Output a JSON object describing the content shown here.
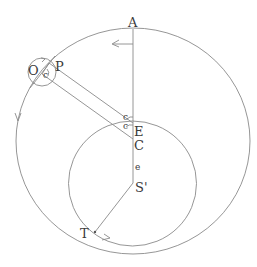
{
  "diagram": {
    "type": "geometric construction (orbit diagram)",
    "colors": {
      "line": "#8a8a8a",
      "text": "#3a3a3a",
      "background": "#ffffff"
    },
    "labels": {
      "A": "A",
      "P": "P",
      "O": "O",
      "E": "E",
      "C": "C",
      "S": "S'",
      "T": "T",
      "e_axis": "e",
      "c_upper": "c",
      "c_lower": "c",
      "c_small_circle": "c"
    },
    "shapes": {
      "outer_circle": "large circle (deferent)",
      "inner_circle": "smaller circle centered on S'",
      "small_circle": "epicycle at O",
      "vertical_line": "line A–S'",
      "band": "parallel lines from O/P to E/C",
      "line_ST": "line S'–T"
    },
    "arrows": [
      "arrow near A pointing left",
      "arrow on outer circle left pointing down",
      "arrow near T pointing right",
      "arrow on small circle"
    ]
  }
}
